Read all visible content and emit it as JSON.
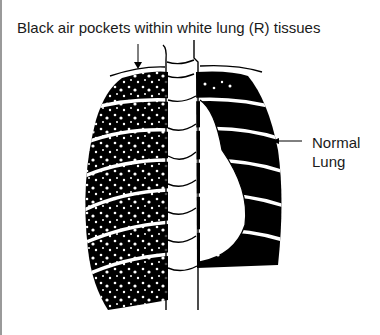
{
  "diagram": {
    "title": "Black air pockets within white lung (R) tissues",
    "annotations": [
      {
        "label_line1": "Normal",
        "label_line2": "Lung",
        "points_to": "left lung (normal)"
      }
    ],
    "colors": {
      "ink": "#000000",
      "background": "#ffffff",
      "border": "#9a9a9a"
    }
  }
}
